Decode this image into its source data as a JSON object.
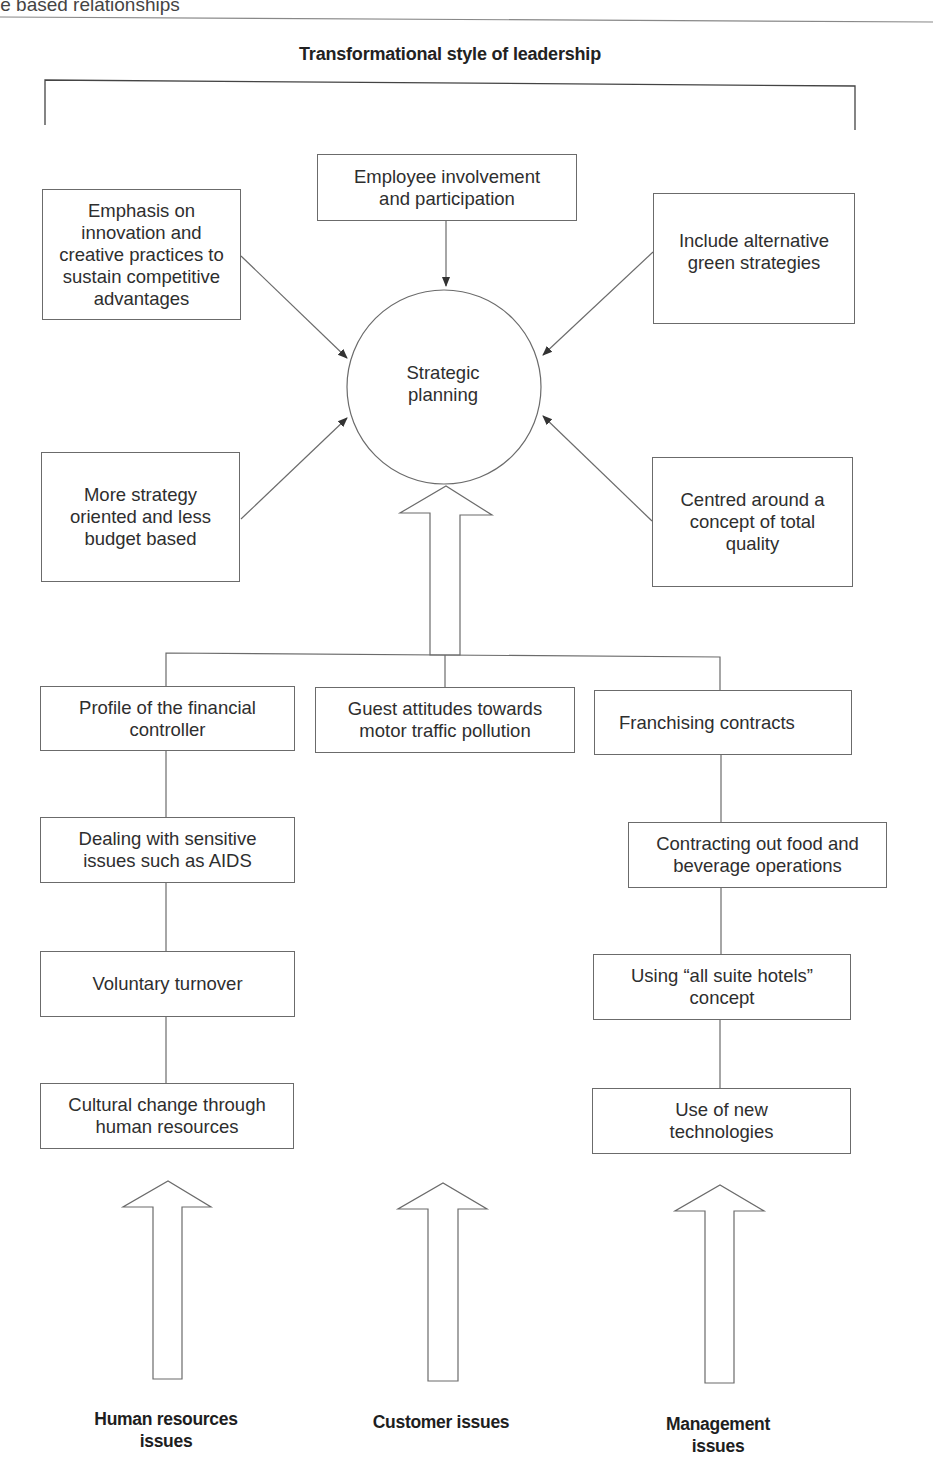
{
  "running_head": "le based relationships",
  "diagram": {
    "title": "Transformational style of leadership",
    "center": {
      "label": "Strategic\nplanning"
    },
    "influences": [
      {
        "id": "innovation",
        "label": "Emphasis on\ninnovation and\ncreative practices to\nsustain competitive\nadvantages"
      },
      {
        "id": "employee",
        "label": "Employee involvement\nand participation"
      },
      {
        "id": "green",
        "label": "Include alternative\ngreen strategies"
      },
      {
        "id": "strategy",
        "label": "More strategy\noriented and less\nbudget based"
      },
      {
        "id": "quality",
        "label": "Centred around a\nconcept of total\nquality"
      }
    ],
    "columns": [
      {
        "category": "Human resources\nissues",
        "items": [
          "Profile of the financial\ncontroller",
          "Dealing with sensitive\nissues such as AIDS",
          "Voluntary turnover",
          "Cultural change through\nhuman resources"
        ]
      },
      {
        "category": "Customer issues",
        "items": [
          "Guest attitudes towards\nmotor traffic pollution"
        ]
      },
      {
        "category": "Management\nissues",
        "items": [
          "Franchising contracts",
          "Contracting out food and\nbeverage operations",
          "Using “all suite hotels”\nconcept",
          "Use of new\ntechnologies"
        ]
      }
    ]
  }
}
